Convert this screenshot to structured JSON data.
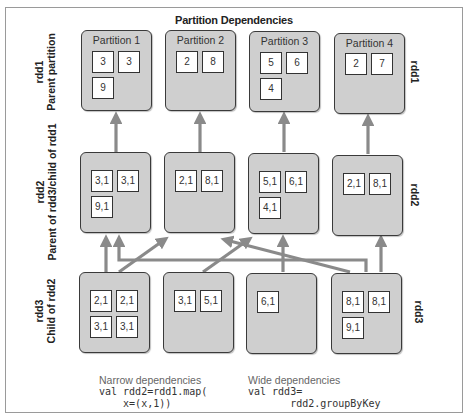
{
  "title": "Partition Dependencies",
  "rows": [
    {
      "id": "rdd1",
      "left_label_line1": "rdd1",
      "left_label_line2": "Parent partition",
      "right_label": "rdd1",
      "partitions": [
        {
          "label": "Partition 1",
          "cells": [
            "3",
            "3",
            "9"
          ]
        },
        {
          "label": "Partition 2",
          "cells": [
            "2",
            "8"
          ]
        },
        {
          "label": "Partition 3",
          "cells": [
            "5",
            "6",
            "4"
          ]
        },
        {
          "label": "Partition 4",
          "cells": [
            "2",
            "7"
          ]
        }
      ]
    },
    {
      "id": "rdd2",
      "left_label_line1": "rdd2",
      "left_label_line2": "Parent of rdd3/child of rdd1",
      "right_label": "rdd2",
      "partitions": [
        {
          "label": "",
          "cells": [
            "3,1",
            "3,1",
            "9,1"
          ]
        },
        {
          "label": "",
          "cells": [
            "2,1",
            "8,1"
          ]
        },
        {
          "label": "",
          "cells": [
            "5,1",
            "6,1",
            "4,1"
          ]
        },
        {
          "label": "",
          "cells": [
            "2,1",
            "8,1"
          ]
        }
      ]
    },
    {
      "id": "rdd3",
      "left_label_line1": "rdd3",
      "left_label_line2": "Child of rdd2",
      "right_label": "rdd3",
      "partitions": [
        {
          "label": "",
          "cells": [
            "2,1",
            "2,1",
            "3,1",
            "3,1"
          ]
        },
        {
          "label": "",
          "cells": [
            "3,1",
            "5,1"
          ]
        },
        {
          "label": "",
          "cells": [
            "6,1"
          ]
        },
        {
          "label": "",
          "cells": [
            "8,1",
            "8,1",
            "9,1"
          ]
        }
      ]
    }
  ],
  "captions": {
    "narrow": {
      "label": "Narrow dependencies",
      "code_line1": "val rdd2=rdd1.map(",
      "code_line2": "    x=(x,1))"
    },
    "wide": {
      "label": "Wide dependencies",
      "code_line1": "val rdd3=",
      "code_line2": "       rdd2.groupByKey"
    }
  },
  "colors": {
    "arrow": "#8a8a8a",
    "partition_fill": "#cfcfcf",
    "partition_border": "#3a3a3a"
  }
}
